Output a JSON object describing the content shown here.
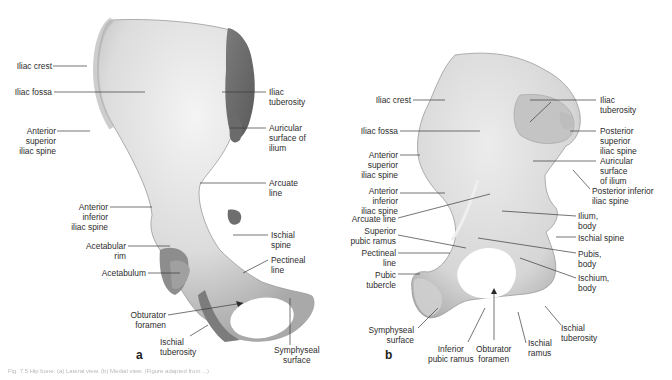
{
  "figure": {
    "panels": [
      {
        "letter": "a",
        "view": "hip bone medial view (left)",
        "labels": {
          "iliac_crest": "Iliac crest",
          "iliac_fossa": "Iliac fossa",
          "asis": "Anterior\nsuperior\niliac spine",
          "aiis": "Anterior\ninferior\niliac spine",
          "acetabular_rim": "Acetabular\nrim",
          "acetabulum": "Acetabulum",
          "obturator_foramen": "Obturator\nforamen",
          "ischial_tuberosity": "Ischial\ntuberosity",
          "iliac_tuberosity": "Iliac\ntuberosity",
          "auricular_surface": "Auricular\nsurface of\nilium",
          "arcuate_line": "Arcuate\nline",
          "ischial_spine": "Ischial\nspine",
          "pectineal_line": "Pectineal\nline",
          "symphyseal_surface": "Symphyseal\nsurface"
        }
      },
      {
        "letter": "b",
        "view": "hip bone medial view (right)",
        "labels": {
          "iliac_crest": "Iliac crest",
          "iliac_fossa": "Iliac fossa",
          "asis": "Anterior\nsuperior\niliac spine",
          "aiis": "Anterior\ninferior\niliac spine",
          "arcuate_line": "Arcuate line",
          "superior_pubic_ramus": "Superior\npubic ramus",
          "pectineal_line": "Pectineal\nline",
          "pubic_tubercle": "Pubic\ntubercle",
          "symphyseal_surface": "Symphyseal\nsurface",
          "inferior_pubic_ramus": "Inferior\npubic ramus",
          "obturator_foramen": "Obturator\nforamen",
          "ischial_ramus": "Ischial\nramus",
          "ischial_tuberosity": "Ischial\ntuberosity",
          "iliac_tuberosity": "Iliac\ntuberosity",
          "psis": "Posterior\nsuperior\niliac spine",
          "auricular_surface": "Auricular\nsurface\nof ilium",
          "piis": "Posterior inferior\niliac spine",
          "ilium_body": "Ilium,\nbody",
          "ischial_spine": "Ischial spine",
          "pubis_body": "Pubis,\nbody",
          "ischium_body": "Ischium,\nbody"
        }
      }
    ],
    "caption": "Fig. 7.5 Hip bone: (a) Lateral view. (b) Medial view. (Figure adapted from ...)"
  },
  "colors": {
    "bone_light": "#eeeeee",
    "bone_mid": "#cfcfcf",
    "bone_dark": "#8a8a8a",
    "leader_line": "#3a3a3a",
    "text": "#2d2d2d"
  }
}
